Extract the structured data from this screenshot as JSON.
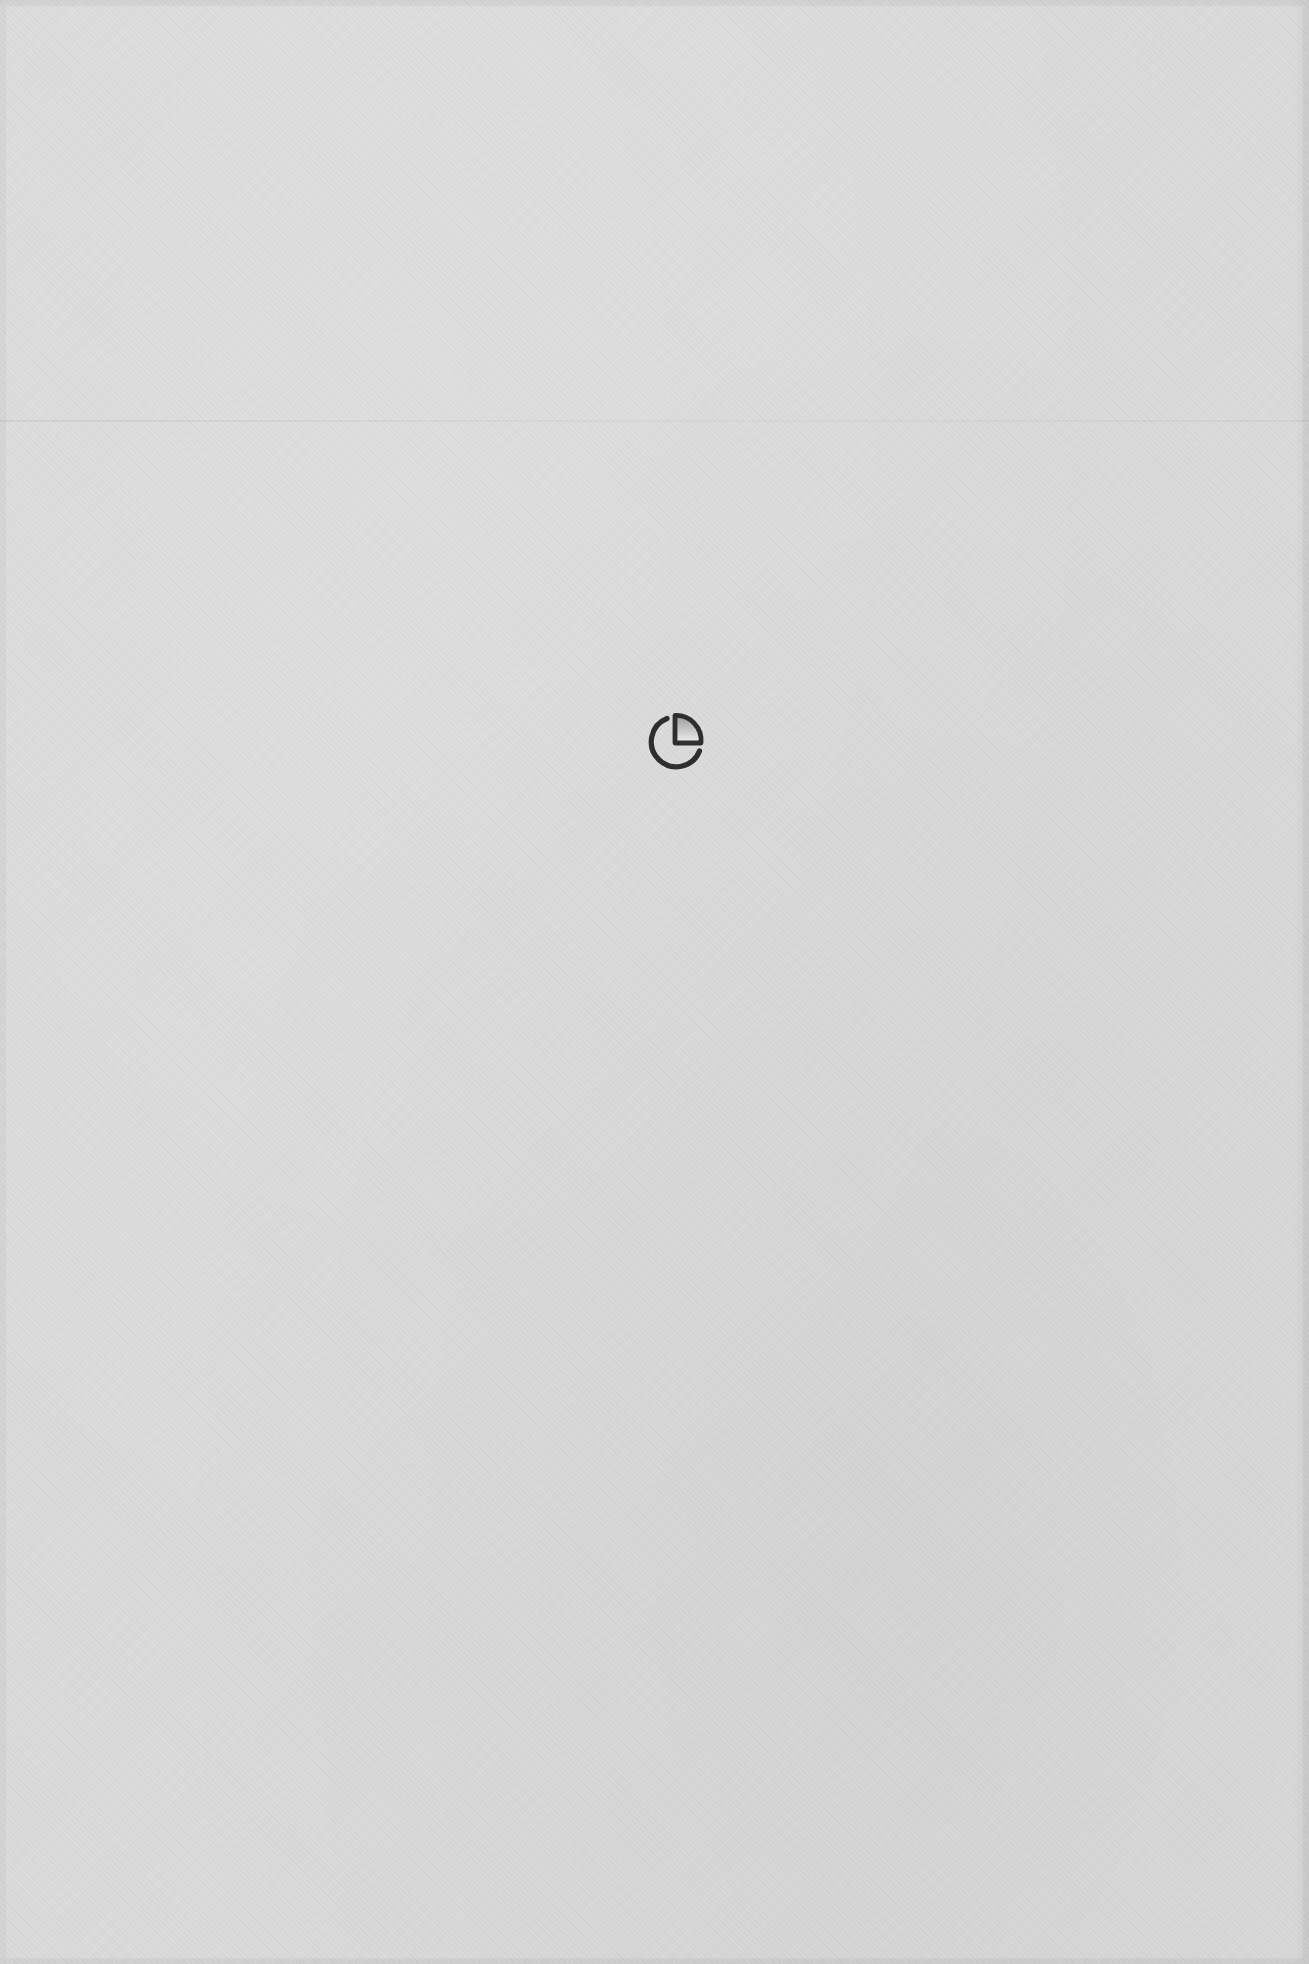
{
  "page": {
    "background_color": "#d9d9d9",
    "icon_color": "#2e2e2e"
  },
  "placeholder": {
    "icon": "pie-chart-icon",
    "caption": ""
  }
}
